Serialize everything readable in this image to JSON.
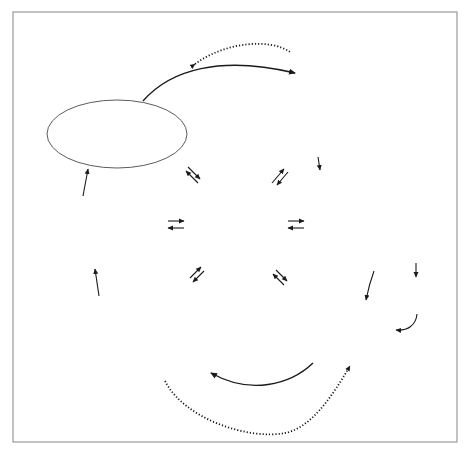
{
  "diagram": {
    "type": "social-information-processing-model",
    "center": {
      "title": "DATABASE",
      "items": [
        "Memory store",
        "Acquired rules",
        "Social schemas",
        "Social knowledge"
      ]
    },
    "steps": [
      {
        "number": "1",
        "title_lines": [
          "Encoding of cues",
          "(both internal",
          "and external)"
        ],
        "details": []
      },
      {
        "number": "2",
        "title_lines": [
          "Interpretation of cues"
        ],
        "details": [
          "Causal attributions · Intent attributions",
          "Other interpretative processes"
        ]
      },
      {
        "number": "3",
        "title_lines": [
          "Clarification of goals"
        ],
        "details": [
          "Arousal regulation"
        ]
      },
      {
        "number": "4",
        "title_lines": [
          "Response access",
          "or construction"
        ],
        "details": []
      },
      {
        "number": "5",
        "title_lines": [
          "Response decision"
        ],
        "details": [
          "Response evaluation · Outcome",
          "expectations · Self-efficacy evaluation",
          "Response selection"
        ]
      },
      {
        "number": "6",
        "title_lines": [
          "Behavioural",
          "enactment"
        ],
        "details": []
      }
    ],
    "side_label": [
      "Peer evaluation",
      "and response"
    ],
    "flow": [
      "1 → 2",
      "2 → 3",
      "3 → 4",
      "4 → 5",
      "5 → 6",
      "6 → 1",
      "6 → Peer evaluation and response → 1"
    ],
    "bidirectional_links": [
      "Database ⇄ 1",
      "Database ⇄ 2",
      "Database ⇄ 3",
      "Database ⇄ 4",
      "Database ⇄ 5",
      "Database ⇄ 6"
    ],
    "feedback_loops": [
      "dotted loop top (5 → 4 region)",
      "dotted loop bottom (2 → 1 region)"
    ],
    "colors": {
      "database_fill": "#c9c9c9",
      "badge_fill": "#cfcfcf",
      "stroke": "#4a4a4a",
      "frame": "#9a9a9a"
    }
  }
}
